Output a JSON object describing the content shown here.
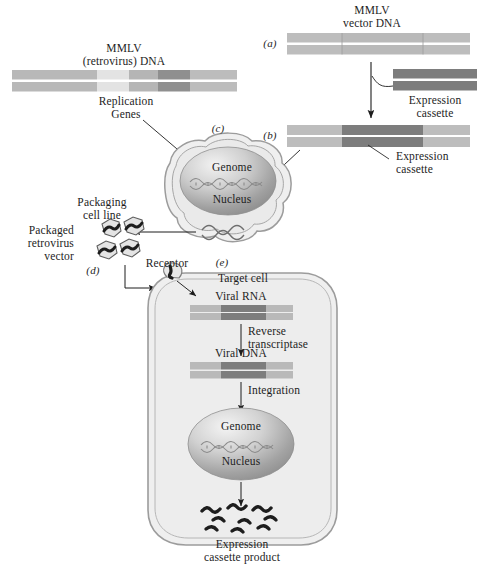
{
  "figure": {
    "title_top_left": "MMLV\n(retrovirus) DNA",
    "title_top_right": "MMLV\nvector DNA",
    "panel_labels": {
      "a": "(a)",
      "b": "(b)",
      "c": "(c)",
      "d": "(d)",
      "e": "(e)"
    }
  },
  "labels": {
    "replication_genes": "Replication\nGenes",
    "expression_cassette_1": "Expression\ncassette",
    "expression_cassette_2": "Expression\ncassette",
    "packaging_cell_line": "Packaging\ncell line",
    "packaged_retrovirus_vector": "Packaged\nretrovirus\nvector",
    "receptor": "Receptor",
    "target_cell": "Target cell",
    "viral_rna": "Viral RNA",
    "reverse_transcriptase": "Reverse\ntranscriptase",
    "viral_dna": "Viral DNA",
    "integration": "Integration",
    "genome_c": "Genome",
    "nucleus_c": "Nucleus",
    "genome_e": "Genome",
    "nucleus_e": "Nucleus",
    "expression_cassette_product": "Expression\ncassette product"
  },
  "colors": {
    "dna_light": "#d2d2d2",
    "dna_mid": "#b4b4b4",
    "dna_pale": "#e2e2e2",
    "dna_dark": "#8d8d8d",
    "cassette_dark": "#7b7b7b",
    "cell_fill": "#efefef",
    "cell_stroke": "#9a9a9a",
    "cell_inner": "#e8e8e8",
    "nucleus_light": "#e6e6e6",
    "nucleus_dark": "#8e8e8e",
    "ink": "#1d1d1d"
  },
  "dna_constructs": {
    "mmlv_retrovirus": {
      "name": "MMLV (retrovirus) DNA",
      "strands": 2,
      "segments": [
        {
          "id": "ltr-left",
          "shade": "dna_mid",
          "width_pct": 38
        },
        {
          "id": "pale-region",
          "shade": "dna_pale",
          "width_pct": 14
        },
        {
          "id": "mid-region",
          "shade": "dna_mid",
          "width_pct": 13
        },
        {
          "id": "replication-genes",
          "shade": "dna_dark",
          "width_pct": 14
        },
        {
          "id": "ltr-right",
          "shade": "dna_mid",
          "width_pct": 21
        }
      ]
    },
    "mmlv_vector_a": {
      "name": "MMLV vector DNA",
      "strands": 2,
      "segments": [
        {
          "id": "ltr-left",
          "shade": "dna_mid",
          "width_pct": 29
        },
        {
          "id": "deleted-region",
          "shade": "dna_mid",
          "width_pct": 45
        },
        {
          "id": "ltr-right",
          "shade": "dna_mid",
          "width_pct": 26
        }
      ]
    },
    "expression_cassette": {
      "name": "Expression cassette",
      "strands": 2,
      "segments": [
        {
          "id": "cassette",
          "shade": "cassette_dark",
          "width_pct": 100
        }
      ]
    },
    "vector_b": {
      "name": "MMLV vector with cassette",
      "strands": 2,
      "segments": [
        {
          "id": "ltr-left",
          "shade": "dna_mid",
          "width_pct": 29
        },
        {
          "id": "cassette",
          "shade": "cassette_dark",
          "width_pct": 45
        },
        {
          "id": "ltr-right",
          "shade": "dna_mid",
          "width_pct": 26
        }
      ]
    },
    "viral_rna": {
      "name": "Viral RNA",
      "strands": 2,
      "segments": [
        {
          "id": "ltr-left",
          "shade": "dna_mid",
          "width_pct": 30
        },
        {
          "id": "cassette",
          "shade": "cassette_dark",
          "width_pct": 44
        },
        {
          "id": "ltr-right",
          "shade": "dna_mid",
          "width_pct": 26
        }
      ]
    },
    "viral_dna": {
      "name": "Viral DNA",
      "strands": 2,
      "segments": [
        {
          "id": "ltr-left",
          "shade": "dna_mid",
          "width_pct": 30
        },
        {
          "id": "cassette",
          "shade": "cassette_dark",
          "width_pct": 44
        },
        {
          "id": "ltr-right",
          "shade": "dna_mid",
          "width_pct": 26
        }
      ]
    }
  },
  "virus_particles": {
    "count": 4,
    "shape": "hexagon",
    "contents": "squiggle"
  },
  "product_molecules": {
    "count": 8,
    "shape": "squiggle"
  }
}
